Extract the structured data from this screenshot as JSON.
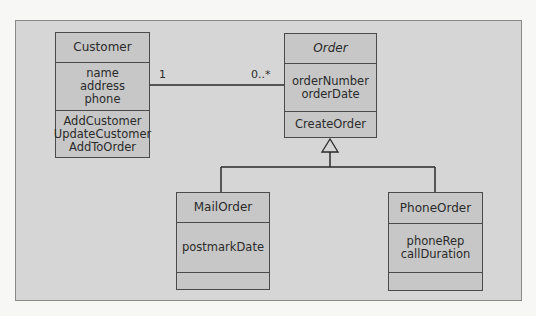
{
  "diagram": {
    "type": "UML class diagram",
    "classes": {
      "customer": {
        "name": "Customer",
        "attributes": [
          "name",
          "address",
          "phone"
        ],
        "operations": [
          "AddCustomer",
          "UpdateCustomer",
          "AddToOrder"
        ]
      },
      "order": {
        "name": "Order",
        "abstract": true,
        "attributes": [
          "orderNumber",
          "orderDate"
        ],
        "operations": [
          "CreateOrder"
        ]
      },
      "mail_order": {
        "name": "MailOrder",
        "attributes": [
          "postmarkDate"
        ],
        "operations": []
      },
      "phone_order": {
        "name": "PhoneOrder",
        "attributes": [
          "phoneRep",
          "callDuration"
        ],
        "operations": []
      }
    },
    "association": {
      "from": "Customer",
      "to": "Order",
      "from_multiplicity": "1",
      "to_multiplicity": "0..*"
    },
    "generalization": {
      "parent": "Order",
      "children": [
        "MailOrder",
        "PhoneOrder"
      ]
    },
    "colors": {
      "panel": "#d6d6d6",
      "class_fill": "#c7c7c7",
      "line": "#2a2a2a"
    }
  }
}
